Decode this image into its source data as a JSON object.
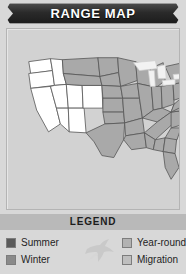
{
  "header": {
    "title": "RANGE MAP",
    "banner_bg": "#2a2a2a",
    "banner_text_color": "#ffffff"
  },
  "map": {
    "region": "United States",
    "panel_bg": "#d2d2d2",
    "border_color": "#555555",
    "fills": {
      "summer": "#a9a9a9",
      "winter": "#ffffff",
      "year_round": "#c4c4c4",
      "migration": "#bdbdbd",
      "water": "#f2f2f2"
    },
    "shaded_region_note": "Eastern and central states shaded (summer range); western states unshaded"
  },
  "legend": {
    "title": "LEGEND",
    "bar_bg": "#b9b9b9",
    "bird_icon": "bird-silhouette-icon",
    "items_left": [
      {
        "label": "Summer",
        "color": "#5a5a5a"
      },
      {
        "label": "Winter",
        "color": "#8a8a8a"
      }
    ],
    "items_right": [
      {
        "label": "Year-round",
        "color": "#b2b2b2"
      },
      {
        "label": "Migration",
        "color": "#bfbfbf"
      }
    ]
  }
}
